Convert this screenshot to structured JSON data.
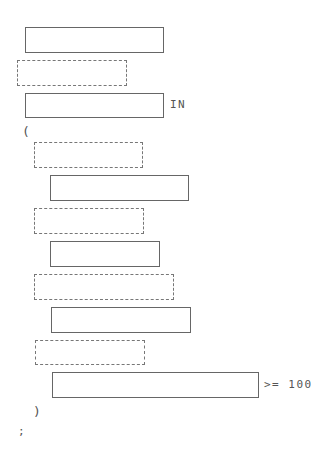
{
  "diagram": {
    "type": "syntax-fill-in-template",
    "tokens": {
      "in_keyword": "IN",
      "open_paren": "(",
      "close_paren": ")",
      "comparison": ">= 100",
      "terminator": ";"
    },
    "slots": [
      {
        "id": "slot-1",
        "style": "solid",
        "x": 25,
        "y": 27,
        "w": 139,
        "h": 26
      },
      {
        "id": "slot-2",
        "style": "dashed",
        "x": 17,
        "y": 60,
        "w": 110,
        "h": 26
      },
      {
        "id": "slot-3",
        "style": "solid",
        "x": 25,
        "y": 93,
        "w": 139,
        "h": 25
      },
      {
        "id": "slot-4",
        "style": "dashed",
        "x": 34,
        "y": 142,
        "w": 109,
        "h": 26
      },
      {
        "id": "slot-5",
        "style": "solid",
        "x": 50,
        "y": 175,
        "w": 139,
        "h": 26
      },
      {
        "id": "slot-6",
        "style": "dashed",
        "x": 34,
        "y": 208,
        "w": 110,
        "h": 26
      },
      {
        "id": "slot-7",
        "style": "solid",
        "x": 50,
        "y": 241,
        "w": 110,
        "h": 26
      },
      {
        "id": "slot-8",
        "style": "dashed",
        "x": 34,
        "y": 274,
        "w": 140,
        "h": 26
      },
      {
        "id": "slot-9",
        "style": "solid",
        "x": 51,
        "y": 307,
        "w": 140,
        "h": 26
      },
      {
        "id": "slot-10",
        "style": "dashed",
        "x": 35,
        "y": 340,
        "w": 110,
        "h": 25
      },
      {
        "id": "slot-11",
        "style": "solid",
        "x": 52,
        "y": 372,
        "w": 207,
        "h": 26
      }
    ]
  }
}
